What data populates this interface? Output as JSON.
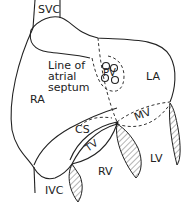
{
  "diagram": {
    "type": "anatomical-heart-schematic",
    "labels": {
      "svc": "SVC",
      "ivc": "IVC",
      "ra": "RA",
      "la": "LA",
      "rv": "RV",
      "lv": "LV",
      "pv": "PV",
      "cs": "CS",
      "tv": "TV",
      "mv": "MV",
      "septum_line1": "Line of",
      "septum_line2": "atrial",
      "septum_line3": "septum"
    },
    "colors": {
      "stroke": "#222222",
      "background": "#ffffff"
    }
  }
}
